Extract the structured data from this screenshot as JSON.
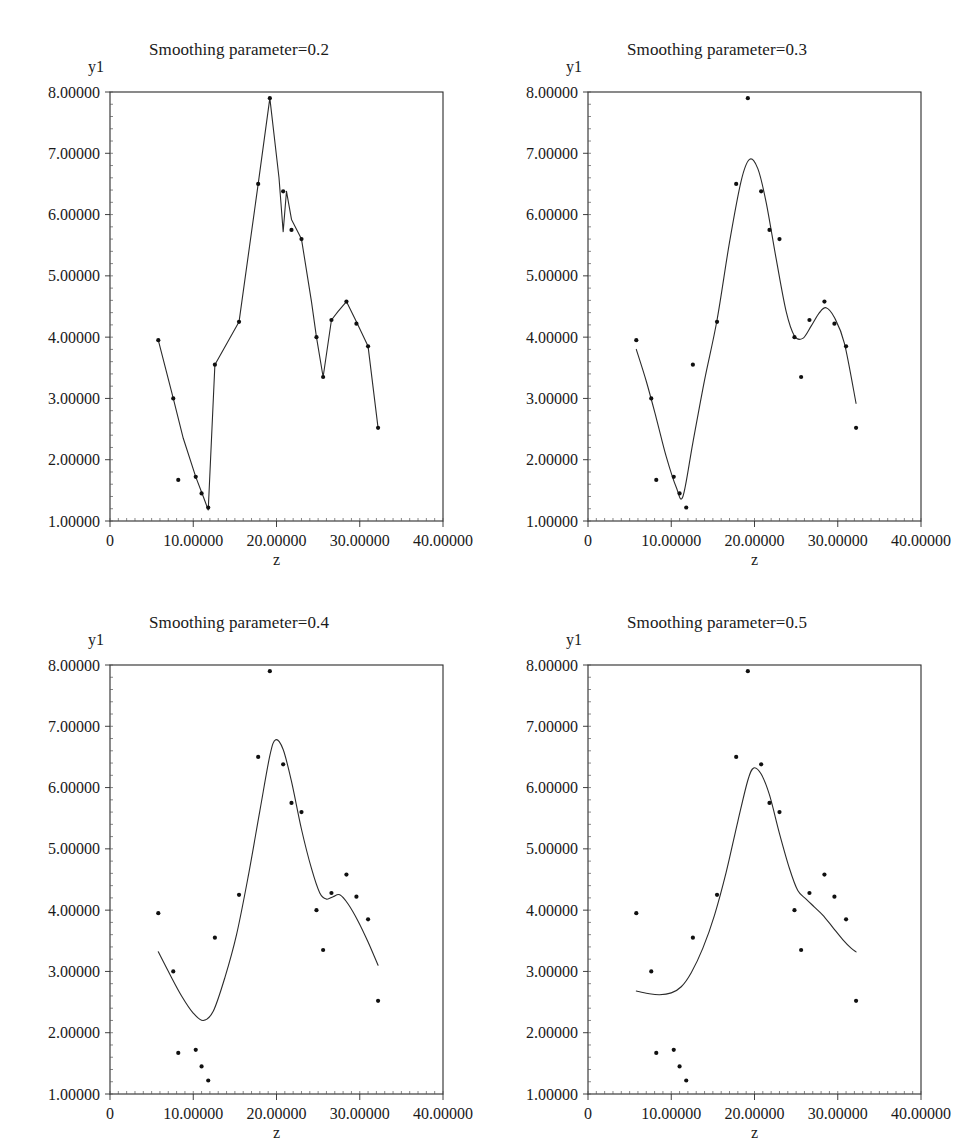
{
  "figure": {
    "kind": "scatter-with-smoothing-spline-grid",
    "rows": 2,
    "cols": 2
  },
  "axis": {
    "ylabel": "y1",
    "xlabel": "z",
    "y_ticks": [
      "1.00000",
      "2.00000",
      "3.00000",
      "4.00000",
      "5.00000",
      "6.00000",
      "7.00000",
      "8.00000"
    ],
    "x_ticks": [
      "0",
      "10.00000",
      "20.00000",
      "30.00000",
      "40.00000"
    ],
    "xlim": [
      0,
      40
    ],
    "ylim": [
      1,
      8
    ],
    "line_color": "#2b2b2b",
    "marker_color": "#101010",
    "background": "#ffffff"
  },
  "chart_data": {
    "type": "scatter",
    "xlabel": "z",
    "ylabel": "y1",
    "xlim": [
      0,
      40
    ],
    "ylim": [
      1,
      8
    ],
    "grid": false,
    "legend": "none",
    "x": [
      5.8,
      7.6,
      8.2,
      10.3,
      10.6,
      11.8,
      12.6,
      15.5,
      17.8,
      19.2,
      20.5,
      21.8,
      23.0,
      24.0,
      25.2,
      25.8,
      27.0,
      28.5,
      29.8,
      31.0,
      32.2
    ],
    "points": [
      {
        "z": 5.8,
        "y1": 3.95
      },
      {
        "z": 7.6,
        "y1": 3.0
      },
      {
        "z": 8.2,
        "y1": 1.67
      },
      {
        "z": 10.3,
        "y1": 1.72
      },
      {
        "z": 11.0,
        "y1": 1.45
      },
      {
        "z": 11.8,
        "y1": 1.22
      },
      {
        "z": 12.6,
        "y1": 3.55
      },
      {
        "z": 15.5,
        "y1": 4.25
      },
      {
        "z": 17.8,
        "y1": 6.5
      },
      {
        "z": 19.2,
        "y1": 7.9
      },
      {
        "z": 20.8,
        "y1": 6.38
      },
      {
        "z": 21.8,
        "y1": 5.75
      },
      {
        "z": 23.0,
        "y1": 5.6
      },
      {
        "z": 24.8,
        "y1": 4.0
      },
      {
        "z": 25.6,
        "y1": 3.35
      },
      {
        "z": 26.6,
        "y1": 4.28
      },
      {
        "z": 28.4,
        "y1": 4.58
      },
      {
        "z": 29.6,
        "y1": 4.22
      },
      {
        "z": 31.0,
        "y1": 3.85
      },
      {
        "z": 32.2,
        "y1": 2.52
      }
    ],
    "panels": [
      {
        "id": "sp02",
        "title": "Smoothing parameter=0.2",
        "smoothing_parameter": 0.2,
        "curve": [
          [
            5.8,
            3.95
          ],
          [
            7.6,
            3.0
          ],
          [
            8.8,
            2.35
          ],
          [
            10.3,
            1.72
          ],
          [
            11.2,
            1.4
          ],
          [
            11.8,
            1.18
          ],
          [
            12.6,
            3.55
          ],
          [
            15.5,
            4.25
          ],
          [
            17.8,
            6.5
          ],
          [
            19.2,
            7.9
          ],
          [
            20.3,
            6.6
          ],
          [
            20.8,
            5.72
          ],
          [
            21.2,
            6.38
          ],
          [
            21.8,
            5.92
          ],
          [
            23.0,
            5.6
          ],
          [
            24.2,
            4.58
          ],
          [
            24.8,
            4.0
          ],
          [
            25.6,
            3.35
          ],
          [
            26.6,
            4.28
          ],
          [
            27.4,
            4.42
          ],
          [
            28.4,
            4.58
          ],
          [
            29.6,
            4.25
          ],
          [
            31.0,
            3.85
          ],
          [
            32.2,
            2.52
          ]
        ]
      },
      {
        "id": "sp03",
        "title": "Smoothing parameter=0.3",
        "smoothing_parameter": 0.3,
        "curve": [
          [
            5.8,
            3.8
          ],
          [
            7.0,
            3.28
          ],
          [
            8.2,
            2.68
          ],
          [
            9.4,
            2.05
          ],
          [
            10.6,
            1.55
          ],
          [
            11.4,
            1.4
          ],
          [
            12.6,
            2.28
          ],
          [
            14.0,
            3.3
          ],
          [
            15.5,
            4.28
          ],
          [
            17.0,
            5.55
          ],
          [
            18.4,
            6.55
          ],
          [
            19.4,
            6.9
          ],
          [
            20.4,
            6.75
          ],
          [
            21.4,
            6.2
          ],
          [
            22.6,
            5.28
          ],
          [
            23.8,
            4.42
          ],
          [
            24.8,
            4.02
          ],
          [
            25.8,
            3.98
          ],
          [
            26.8,
            4.18
          ],
          [
            27.8,
            4.4
          ],
          [
            28.6,
            4.48
          ],
          [
            29.6,
            4.32
          ],
          [
            30.8,
            3.9
          ],
          [
            32.2,
            2.92
          ]
        ]
      },
      {
        "id": "sp04",
        "title": "Smoothing parameter=0.4",
        "smoothing_parameter": 0.4,
        "curve": [
          [
            5.8,
            3.32
          ],
          [
            7.2,
            2.95
          ],
          [
            8.6,
            2.6
          ],
          [
            10.0,
            2.32
          ],
          [
            11.2,
            2.2
          ],
          [
            12.4,
            2.35
          ],
          [
            13.8,
            2.9
          ],
          [
            15.2,
            3.6
          ],
          [
            16.6,
            4.55
          ],
          [
            18.0,
            5.62
          ],
          [
            19.2,
            6.52
          ],
          [
            19.9,
            6.78
          ],
          [
            20.8,
            6.62
          ],
          [
            21.8,
            6.1
          ],
          [
            23.0,
            5.32
          ],
          [
            24.2,
            4.68
          ],
          [
            25.2,
            4.28
          ],
          [
            26.0,
            4.18
          ],
          [
            26.8,
            4.22
          ],
          [
            27.6,
            4.25
          ],
          [
            28.6,
            4.1
          ],
          [
            29.8,
            3.82
          ],
          [
            31.0,
            3.48
          ],
          [
            32.2,
            3.1
          ]
        ]
      },
      {
        "id": "sp05",
        "title": "Smoothing parameter=0.5",
        "smoothing_parameter": 0.5,
        "curve": [
          [
            5.8,
            2.68
          ],
          [
            7.2,
            2.64
          ],
          [
            8.6,
            2.62
          ],
          [
            10.0,
            2.65
          ],
          [
            11.2,
            2.75
          ],
          [
            12.4,
            2.98
          ],
          [
            13.8,
            3.38
          ],
          [
            15.2,
            3.92
          ],
          [
            16.6,
            4.62
          ],
          [
            18.0,
            5.45
          ],
          [
            19.2,
            6.12
          ],
          [
            19.9,
            6.32
          ],
          [
            20.8,
            6.22
          ],
          [
            21.8,
            5.88
          ],
          [
            23.0,
            5.25
          ],
          [
            24.2,
            4.68
          ],
          [
            25.2,
            4.32
          ],
          [
            26.2,
            4.18
          ],
          [
            27.2,
            4.05
          ],
          [
            28.2,
            3.92
          ],
          [
            29.4,
            3.72
          ],
          [
            30.6,
            3.52
          ],
          [
            31.6,
            3.38
          ],
          [
            32.2,
            3.32
          ]
        ]
      }
    ]
  }
}
